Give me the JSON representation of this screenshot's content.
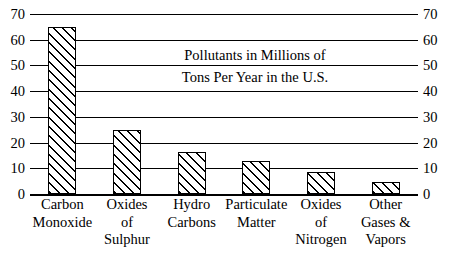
{
  "chart_data": {
    "type": "bar",
    "title_lines": [
      "Pollutants in Millions of",
      "Tons Per Year in the U.S."
    ],
    "xlabel": "",
    "ylabel": "",
    "ylim": [
      0,
      70
    ],
    "yticks": [
      0,
      10,
      20,
      30,
      40,
      50,
      60,
      70
    ],
    "ytick_labels_left": [
      "0",
      "10",
      "20",
      "30",
      "40",
      "50",
      "60",
      "70"
    ],
    "ytick_labels_right": [
      "0",
      "10",
      "20",
      "30",
      "40",
      "50",
      "60",
      "70"
    ],
    "grid": true,
    "grid_axis": "y",
    "legend": false,
    "dual_axis": true,
    "bar_fill": "diagonal-hatch",
    "bar_color": "#000000",
    "categories": [
      "Carbon Monoxide",
      "Oxides of Sulphur",
      "Hydro Carbons",
      "Particulate Matter",
      "Oxides of Nitrogen",
      "Other Gases & Vapors"
    ],
    "category_lines": [
      [
        "Carbon",
        "Monoxide"
      ],
      [
        "Oxides",
        "of",
        "Sulphur"
      ],
      [
        "Hydro",
        "Carbons"
      ],
      [
        "Particulate",
        "Matter"
      ],
      [
        "Oxides",
        "of",
        "Nitrogen"
      ],
      [
        "Other",
        "Gases &",
        "Vapors"
      ]
    ],
    "values": [
      65,
      25,
      16.5,
      12.7,
      8.7,
      4.7
    ]
  }
}
